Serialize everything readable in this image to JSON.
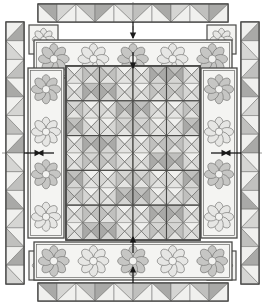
{
  "diagram": {
    "type": "quilt-layout",
    "width": 265,
    "height": 305,
    "background": "#ffffff"
  },
  "palette": {
    "light": "#f0f0ee",
    "light2": "#e4e4e2",
    "mid_light": "#d5d5d3",
    "mid": "#c0c0be",
    "mid_dark": "#a9a9a7",
    "dark": "#8f8f8d",
    "outline": "#6a6a68",
    "heavy_outline": "#4a4a48",
    "sash_fill": "#f4f4f2",
    "petal_light": "#e6e6e4",
    "petal_mid": "#c6c6c4",
    "petal_dark": "#a3a3a1",
    "flower_center": "#f2f2f0",
    "arrow": "#1a1a1a"
  },
  "center_panel": {
    "name": "center-medallion",
    "x": 66,
    "y": 66,
    "width": 134,
    "height": 174,
    "cols": 4,
    "rows": 5,
    "unit_label": "quarter-square-triangle",
    "block_shades": [
      [
        [
          "l",
          "m",
          "l",
          "d"
        ],
        [
          "m",
          "l",
          "d",
          "l"
        ],
        [
          "l",
          "d",
          "l",
          "m"
        ],
        [
          "d",
          "l",
          "m",
          "l"
        ]
      ],
      [
        [
          "m",
          "l",
          "d",
          "l"
        ],
        [
          "l",
          "d",
          "l",
          "m"
        ],
        [
          "d",
          "l",
          "m",
          "l"
        ],
        [
          "l",
          "m",
          "l",
          "d"
        ]
      ],
      [
        [
          "l",
          "d",
          "l",
          "m"
        ],
        [
          "d",
          "l",
          "m",
          "l"
        ],
        [
          "l",
          "m",
          "l",
          "d"
        ],
        [
          "m",
          "l",
          "d",
          "l"
        ]
      ],
      [
        [
          "d",
          "l",
          "m",
          "l"
        ],
        [
          "l",
          "m",
          "l",
          "d"
        ],
        [
          "m",
          "l",
          "d",
          "l"
        ],
        [
          "l",
          "d",
          "l",
          "m"
        ]
      ],
      [
        [
          "l",
          "m",
          "l",
          "d"
        ],
        [
          "m",
          "l",
          "d",
          "l"
        ],
        [
          "l",
          "d",
          "l",
          "m"
        ],
        [
          "d",
          "l",
          "m",
          "l"
        ]
      ]
    ]
  },
  "borders": {
    "top_flower": {
      "name": "top-flower-border",
      "x": 34,
      "y": 40,
      "width": 198,
      "height": 38,
      "flower_count": 5,
      "label": "appliqué flower border"
    },
    "bottom_flower": {
      "name": "bottom-flower-border",
      "x": 34,
      "y": 242,
      "width": 198,
      "height": 38,
      "flower_count": 5,
      "label": "appliqué flower border"
    },
    "left_flower": {
      "name": "left-flower-border",
      "x": 28,
      "y": 68,
      "width": 36,
      "height": 170,
      "flower_count": 4,
      "label": "appliqué flower border"
    },
    "right_flower": {
      "name": "right-flower-border",
      "x": 201,
      "y": 68,
      "width": 36,
      "height": 170,
      "flower_count": 4,
      "label": "appliqué flower border"
    },
    "top_sawtooth": {
      "name": "top-sawtooth-border",
      "x": 38,
      "y": 4,
      "width": 190,
      "height": 18,
      "units": 10,
      "label": "half-square-triangle border"
    },
    "bottom_sawtooth": {
      "name": "bottom-sawtooth-border",
      "x": 38,
      "y": 283,
      "width": 190,
      "height": 18,
      "units": 10,
      "label": "half-square-triangle border"
    },
    "left_sawtooth": {
      "name": "left-sawtooth-border",
      "x": 6,
      "y": 22,
      "width": 18,
      "height": 262,
      "units": 14,
      "label": "half-square-triangle border"
    },
    "right_sawtooth": {
      "name": "right-sawtooth-border",
      "x": 241,
      "y": 22,
      "width": 18,
      "height": 262,
      "units": 14,
      "label": "half-square-triangle border"
    }
  },
  "corner_blocks": [
    {
      "name": "corner-block-top-left",
      "x": 29,
      "y": 25,
      "size": 29
    },
    {
      "name": "corner-block-top-right",
      "x": 207,
      "y": 25,
      "size": 29
    },
    {
      "name": "corner-block-bottom-left",
      "x": 29,
      "y": 251,
      "size": 29
    },
    {
      "name": "corner-block-bottom-right",
      "x": 207,
      "y": 251,
      "size": 29
    }
  ],
  "assembly_arrows": [
    {
      "name": "arrow-top-outer",
      "x": 133,
      "y": 22,
      "dir": "down",
      "length": 16
    },
    {
      "name": "arrow-top-inner",
      "x": 133,
      "y": 52,
      "dir": "down",
      "length": 16
    },
    {
      "name": "arrow-bottom-outer",
      "x": 133,
      "y": 283,
      "dir": "up",
      "length": 16
    },
    {
      "name": "arrow-bottom-inner",
      "x": 133,
      "y": 253,
      "dir": "up",
      "length": 16
    },
    {
      "name": "arrow-left-outer",
      "x": 24,
      "y": 153,
      "dir": "right",
      "length": 16
    },
    {
      "name": "arrow-left-inner",
      "x": 54,
      "y": 153,
      "dir": "left",
      "length": 16
    },
    {
      "name": "arrow-right-outer",
      "x": 241,
      "y": 153,
      "dir": "left",
      "length": 16
    },
    {
      "name": "arrow-right-inner",
      "x": 211,
      "y": 153,
      "dir": "right",
      "length": 16
    }
  ],
  "guide_lines": {
    "vertical_center_x": 133,
    "horizontal_center_y": 153,
    "style": "dashed"
  }
}
